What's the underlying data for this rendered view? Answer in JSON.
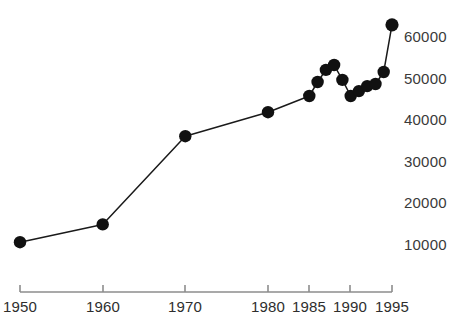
{
  "chart_data": {
    "type": "line",
    "title": "",
    "subtitle": "",
    "xlabel": "",
    "ylabel": "",
    "x": [
      1950,
      1960,
      1970,
      1980,
      1985,
      1986,
      1987,
      1988,
      1989,
      1990,
      1991,
      1992,
      1993,
      1994,
      1995
    ],
    "values": [
      10200,
      14500,
      35800,
      41600,
      45500,
      48900,
      51800,
      53000,
      49400,
      45500,
      46700,
      47900,
      48400,
      51300,
      62700
    ],
    "series": [
      {
        "name": "series-1",
        "values": [
          10200,
          14500,
          35800,
          41600,
          45500,
          48900,
          51800,
          53000,
          49400,
          45500,
          46700,
          47900,
          48400,
          51300,
          62700
        ]
      }
    ],
    "xlim": [
      1950,
      1995
    ],
    "ylim": [
      0,
      65000
    ],
    "grid": false,
    "legend": null,
    "marker": "filled-circle",
    "line_color": "#1a1a1a",
    "marker_color": "#111111",
    "y_ticks": [
      10000,
      20000,
      30000,
      40000,
      50000,
      60000
    ],
    "y_tick_labels": [
      "10000",
      "20000",
      "30000",
      "40000",
      "50000",
      "60000"
    ],
    "y_axis_position": "right",
    "x_ticks": [
      1950,
      1960,
      1970,
      1980,
      1985,
      1990,
      1995
    ],
    "x_tick_labels": [
      "1950",
      "1960",
      "1970",
      "1980",
      "1985",
      "1990",
      "1995"
    ],
    "x_axis_position": "bottom",
    "annotations": []
  },
  "axes": {
    "y_labels": [
      "60000",
      "50000",
      "40000",
      "30000",
      "20000",
      "10000"
    ],
    "x_labels": [
      "1950",
      "1960",
      "1970",
      "1980",
      "1985",
      "1990",
      "1995"
    ]
  },
  "footer": {
    "clipped_text": ""
  }
}
